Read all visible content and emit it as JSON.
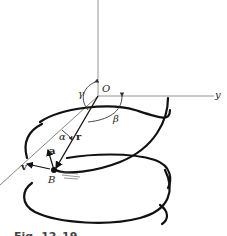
{
  "figure": {
    "caption": "Fig. 12–19",
    "axes": {
      "y_label": "y",
      "origin_label": "O"
    },
    "angles": {
      "alpha": "α",
      "beta": "β",
      "gamma": "γ"
    },
    "vectors": {
      "position": "r",
      "velocity": "v",
      "acceleration": "a"
    },
    "point_label": "B"
  }
}
